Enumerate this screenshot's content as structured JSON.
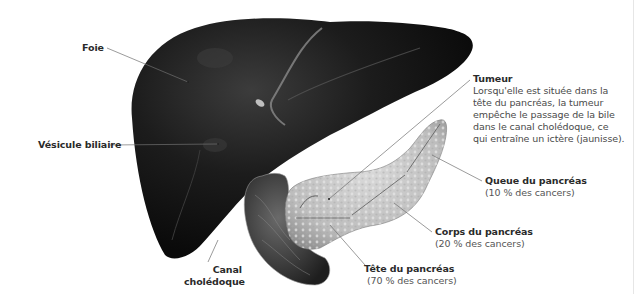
{
  "figure": {
    "colors": {
      "liver": "#141414",
      "liver_highlight": "#4a4a4a",
      "pancreas": "#c9c9c9",
      "duodenum": "#3a3a3a",
      "leader_line": "#6e6e6e",
      "label_text": "#3a3a3a"
    }
  },
  "labels": {
    "foie": {
      "title": "Foie"
    },
    "vesicule": {
      "title": "Vésicule biliaire"
    },
    "tumeur": {
      "title": "Tumeur",
      "body": "Lorsqu'elle est située dans la tête du pancréas, la tumeur empêche le passage de la bile dans le canal cholédoque, ce qui entraîne un ictère (jaunisse)."
    },
    "queue": {
      "title": "Queue du pancréas",
      "sub": "(10 % des cancers)"
    },
    "corps": {
      "title": "Corps du pancréas",
      "sub": "(20 % des cancers)"
    },
    "tete": {
      "title": "Tête du pancréas",
      "sub": "(70 % des cancers)"
    },
    "canal": {
      "line1": "Canal",
      "line2": "cholédoque"
    }
  }
}
